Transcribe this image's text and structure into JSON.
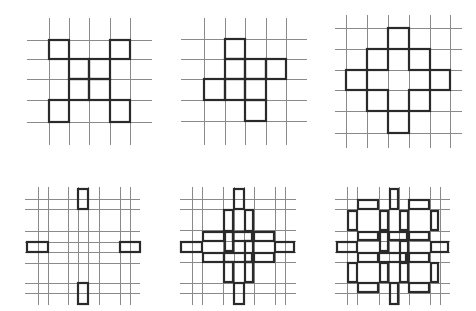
{
  "diagram": {
    "panels": [
      {
        "id": "panel-1",
        "vlines": [
          49,
          69,
          89,
          110,
          130
        ],
        "vspan": [
          18,
          145
        ],
        "hlines": [
          40,
          59,
          79,
          100,
          122
        ],
        "hspan": [
          27,
          152
        ],
        "rects": [
          [
            49,
            40,
            20,
            19
          ],
          [
            110,
            40,
            20,
            19
          ],
          [
            69,
            59,
            20,
            20
          ],
          [
            89,
            59,
            21,
            20
          ],
          [
            69,
            79,
            20,
            21
          ],
          [
            89,
            79,
            21,
            21
          ],
          [
            49,
            100,
            20,
            22
          ],
          [
            110,
            100,
            20,
            22
          ]
        ]
      },
      {
        "id": "panel-2",
        "vlines": [
          204,
          225,
          245,
          266,
          286
        ],
        "vspan": [
          18,
          145
        ],
        "hlines": [
          39,
          59,
          79,
          100,
          121
        ],
        "hspan": [
          181,
          307
        ],
        "rects": [
          [
            225,
            39,
            20,
            20
          ],
          [
            225,
            59,
            20,
            20
          ],
          [
            245,
            59,
            21,
            20
          ],
          [
            266,
            59,
            20,
            20
          ],
          [
            204,
            79,
            21,
            21
          ],
          [
            225,
            79,
            20,
            21
          ],
          [
            245,
            79,
            21,
            21
          ],
          [
            245,
            100,
            21,
            21
          ]
        ]
      },
      {
        "id": "panel-3",
        "vlines": [
          346,
          367,
          388,
          409,
          430,
          450
        ],
        "vspan": [
          15,
          148
        ],
        "hlines": [
          28,
          49,
          70,
          90,
          111,
          133
        ],
        "hspan": [
          335,
          462
        ],
        "rects": [
          [
            388,
            28,
            21,
            21
          ],
          [
            367,
            49,
            21,
            21
          ],
          [
            409,
            49,
            21,
            21
          ],
          [
            346,
            70,
            21,
            20
          ],
          [
            430,
            70,
            20,
            20
          ],
          [
            367,
            90,
            21,
            21
          ],
          [
            409,
            90,
            21,
            21
          ],
          [
            388,
            111,
            21,
            22
          ]
        ]
      },
      {
        "id": "panel-4",
        "vlines": [
          38,
          48,
          68,
          78,
          88,
          99,
          120,
          130
        ],
        "vspan": [
          187,
          305
        ],
        "hlines": [
          199,
          209,
          231,
          242,
          252,
          263,
          283,
          293
        ],
        "hspan": [
          25,
          140
        ],
        "rects": [
          [
            78,
            189,
            10,
            20
          ],
          [
            27,
            242,
            21,
            10
          ],
          [
            120,
            242,
            20,
            10
          ],
          [
            78,
            283,
            10,
            21
          ]
        ]
      },
      {
        "id": "panel-5",
        "vlines": [
          192,
          202,
          223,
          234,
          244,
          254,
          275,
          285
        ],
        "vspan": [
          187,
          305
        ],
        "hlines": [
          199,
          209,
          230,
          241,
          252,
          262,
          283,
          293
        ],
        "hspan": [
          180,
          296
        ],
        "rects": [
          [
            234,
            189,
            10,
            20
          ],
          [
            224,
            210,
            9,
            21
          ],
          [
            245,
            210,
            8,
            21
          ],
          [
            203,
            232,
            21,
            9
          ],
          [
            254,
            232,
            20,
            9
          ],
          [
            233,
            232,
            19,
            9
          ],
          [
            181,
            242,
            21,
            10
          ],
          [
            275,
            242,
            19,
            10
          ],
          [
            225,
            232,
            8,
            19
          ],
          [
            245,
            241,
            8,
            21
          ],
          [
            203,
            253,
            21,
            9
          ],
          [
            254,
            253,
            20,
            9
          ],
          [
            224,
            253,
            28,
            9
          ],
          [
            224,
            262,
            9,
            20
          ],
          [
            245,
            262,
            8,
            20
          ],
          [
            234,
            283,
            10,
            21
          ]
        ]
      },
      {
        "id": "panel-6",
        "vlines": [
          347,
          357,
          379,
          389,
          399,
          409,
          430,
          440
        ],
        "vspan": [
          187,
          305
        ],
        "hlines": [
          199,
          209,
          231,
          241,
          252,
          262,
          283,
          293
        ],
        "hspan": [
          335,
          450
        ],
        "rects": [
          [
            390,
            189,
            8,
            20
          ],
          [
            358,
            200,
            20,
            9
          ],
          [
            409,
            200,
            20,
            9
          ],
          [
            348,
            211,
            9,
            19
          ],
          [
            431,
            211,
            7,
            19
          ],
          [
            380,
            211,
            8,
            19
          ],
          [
            400,
            211,
            8,
            19
          ],
          [
            358,
            232,
            20,
            8
          ],
          [
            409,
            232,
            20,
            8
          ],
          [
            389,
            232,
            18,
            8
          ],
          [
            337,
            242,
            20,
            10
          ],
          [
            431,
            242,
            17,
            10
          ],
          [
            380,
            232,
            8,
            19
          ],
          [
            400,
            241,
            8,
            21
          ],
          [
            358,
            253,
            20,
            9
          ],
          [
            409,
            253,
            20,
            9
          ],
          [
            379,
            253,
            27,
            9
          ],
          [
            348,
            263,
            9,
            19
          ],
          [
            431,
            263,
            7,
            19
          ],
          [
            380,
            263,
            8,
            19
          ],
          [
            400,
            263,
            8,
            19
          ],
          [
            358,
            283,
            20,
            9
          ],
          [
            409,
            283,
            20,
            9
          ],
          [
            390,
            283,
            8,
            21
          ]
        ]
      }
    ]
  }
}
